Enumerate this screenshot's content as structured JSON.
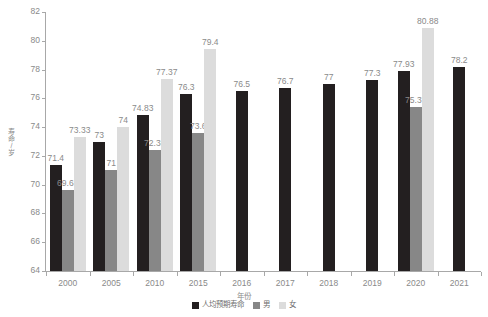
{
  "chart_data": {
    "type": "bar",
    "title": "",
    "xlabel": "年份",
    "ylabel": "寿命/岁",
    "ylim": [
      64,
      82
    ],
    "ytick_step": 2,
    "yticks": [
      "82",
      "80",
      "78",
      "76",
      "74",
      "72",
      "70",
      "68",
      "66",
      "64"
    ],
    "grid": false,
    "legend_position": "bottom",
    "categories": [
      "2000",
      "2005",
      "2010",
      "2015",
      "2016",
      "2017",
      "2018",
      "2019",
      "2020",
      "2021"
    ],
    "series": [
      {
        "name": "人均预期寿命",
        "color": "#231f20",
        "values": [
          71.4,
          73,
          74.83,
          76.3,
          76.5,
          76.7,
          77,
          77.3,
          77.93,
          78.2
        ],
        "labels": [
          "71.4",
          "73",
          "74.83",
          "76.3",
          "76.5",
          "76.7",
          "77",
          "77.3",
          "77.93",
          "78.2"
        ]
      },
      {
        "name": "男",
        "color": "#878787",
        "values": [
          69.63,
          71,
          72.38,
          73.6,
          null,
          null,
          null,
          null,
          75.37,
          null
        ],
        "labels": [
          "69.63",
          "71",
          "72.38",
          "73.6",
          "",
          "",
          "",
          "",
          "75.37",
          ""
        ]
      },
      {
        "name": "女",
        "color": "#dcdcdc",
        "values": [
          73.33,
          74,
          77.37,
          79.4,
          null,
          null,
          null,
          null,
          80.88,
          null
        ],
        "labels": [
          "73.33",
          "74",
          "77.37",
          "79.4",
          "",
          "",
          "",
          "",
          "80.88",
          ""
        ]
      }
    ]
  },
  "legend": {
    "items": [
      {
        "label": "人均预期寿命"
      },
      {
        "label": "男"
      },
      {
        "label": "女"
      }
    ]
  },
  "axes": {
    "y_title": "寿命/岁",
    "x_title": "年份"
  }
}
